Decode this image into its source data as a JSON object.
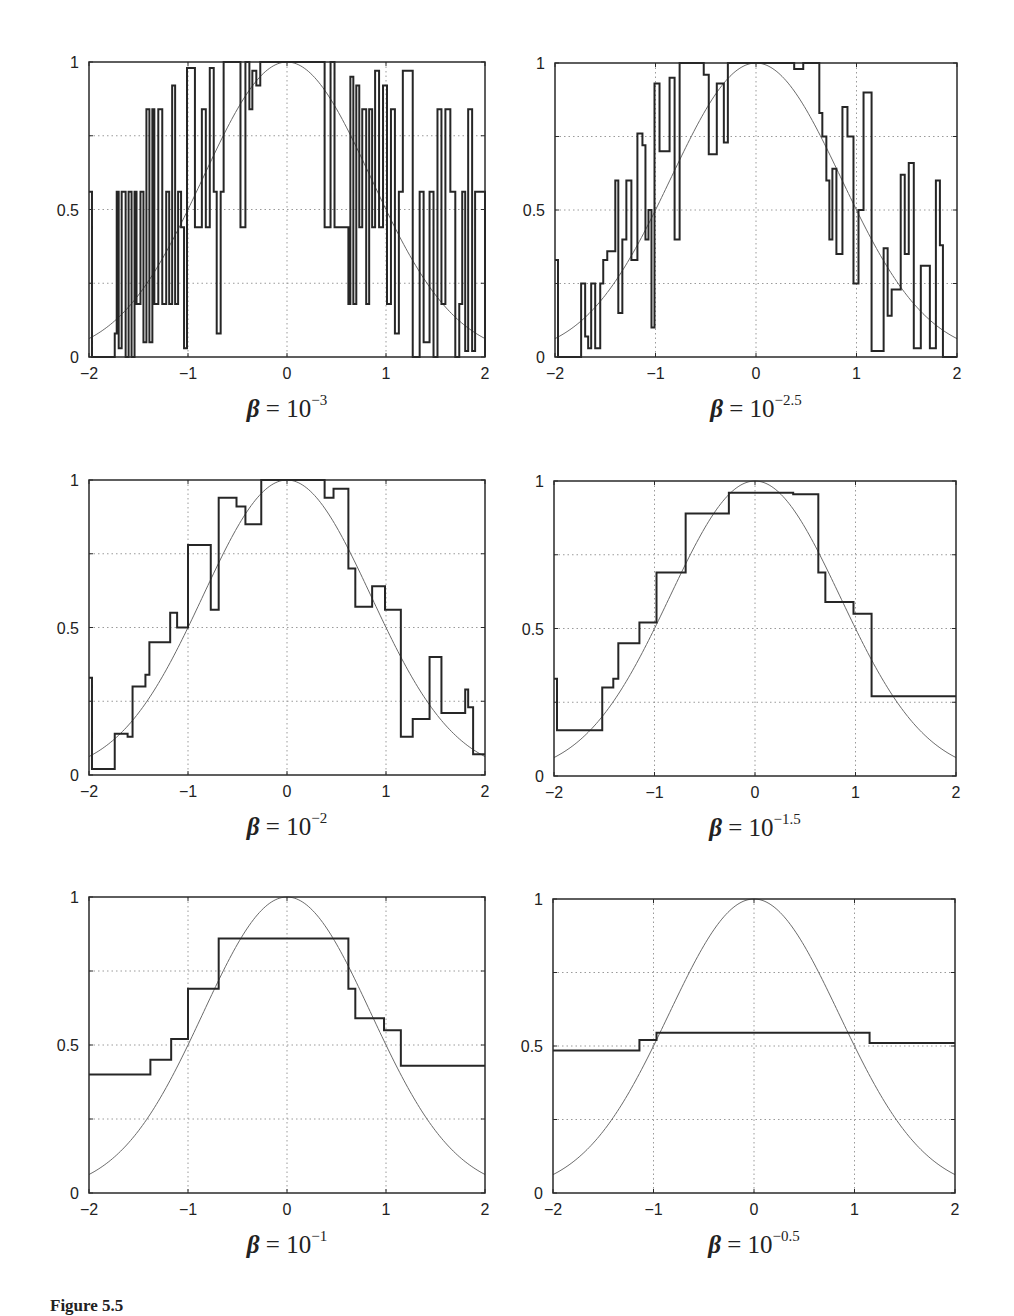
{
  "figure": {
    "label": "Figure 5.5"
  },
  "chart_data": [
    {
      "type": "line",
      "title": "β = 10^-3",
      "caption": {
        "base": "10",
        "exponent": "−3"
      },
      "xlabel": "",
      "ylabel": "",
      "xlim": [
        -2,
        2
      ],
      "ylim": [
        0,
        1
      ],
      "xticks": [
        "−2",
        "−1",
        "0",
        "1",
        "2"
      ],
      "yticks": [
        "0",
        "0.5",
        "1"
      ],
      "grid": true,
      "frame": {
        "left": 89,
        "top": 62,
        "right": 485,
        "bottom": 357
      },
      "series": [
        {
          "name": "target",
          "kind": "smooth",
          "formula": "2^(-x^2)"
        },
        {
          "name": "estimate",
          "kind": "step",
          "x": [
            -2.0,
            -1.97,
            -1.74,
            -1.72,
            -1.7,
            -1.67,
            -1.63,
            -1.6,
            -1.57,
            -1.54,
            -1.52,
            -1.48,
            -1.45,
            -1.42,
            -1.39,
            -1.36,
            -1.34,
            -1.3,
            -1.26,
            -1.22,
            -1.19,
            -1.16,
            -1.13,
            -1.1,
            -1.07,
            -1.04,
            -1.01,
            -0.98,
            -0.93,
            -0.86,
            -0.82,
            -0.78,
            -0.74,
            -0.71,
            -0.67,
            -0.64,
            -0.6,
            -0.55,
            -0.47,
            -0.42,
            -0.38,
            -0.35,
            -0.31,
            -0.27,
            0.38,
            0.44,
            0.48,
            0.62,
            0.64,
            0.67,
            0.7,
            0.73,
            0.76,
            0.8,
            0.83,
            0.86,
            0.89,
            0.93,
            0.97,
            1.01,
            1.05,
            1.09,
            1.13,
            1.17,
            1.27,
            1.31,
            1.34,
            1.38,
            1.44,
            1.48,
            1.52,
            1.56,
            1.6,
            1.65,
            1.7,
            1.74,
            1.77,
            1.8,
            1.83,
            1.87,
            1.9,
            2.0
          ],
          "y": [
            0.56,
            0.0,
            0.08,
            0.56,
            0.03,
            0.56,
            0.0,
            0.56,
            0.0,
            0.56,
            0.18,
            0.56,
            0.05,
            0.84,
            0.05,
            0.84,
            0.18,
            0.84,
            0.18,
            0.56,
            0.18,
            0.92,
            0.18,
            0.56,
            0.44,
            0.03,
            0.98,
            0.98,
            0.44,
            0.84,
            0.44,
            0.98,
            0.56,
            0.08,
            0.56,
            1.0,
            1.0,
            1.0,
            0.44,
            1.0,
            0.84,
            0.97,
            0.92,
            1.0,
            0.44,
            1.0,
            0.44,
            0.18,
            0.95,
            0.18,
            0.92,
            0.44,
            0.84,
            0.18,
            0.84,
            0.44,
            0.97,
            0.44,
            0.92,
            0.18,
            0.84,
            0.08,
            0.56,
            0.97,
            0.0,
            0.0,
            0.56,
            0.05,
            0.56,
            0.0,
            0.84,
            0.18,
            0.84,
            0.56,
            0.0,
            0.18,
            0.56,
            0.02,
            0.84,
            0.02,
            0.56,
            0.0
          ]
        }
      ]
    },
    {
      "type": "line",
      "title": "β = 10^-2.5",
      "caption": {
        "base": "10",
        "exponent": "−2.5"
      },
      "xlabel": "",
      "ylabel": "",
      "xlim": [
        -2,
        2
      ],
      "ylim": [
        0,
        1
      ],
      "xticks": [
        "−2",
        "−1",
        "0",
        "1",
        "2"
      ],
      "yticks": [
        "0",
        "0.5",
        "1"
      ],
      "grid": true,
      "frame": {
        "left": 555,
        "top": 63,
        "right": 957,
        "bottom": 357
      },
      "series": [
        {
          "name": "target",
          "kind": "smooth",
          "formula": "2^(-x^2)"
        },
        {
          "name": "estimate",
          "kind": "step",
          "x": [
            -2.0,
            -1.97,
            -1.74,
            -1.7,
            -1.67,
            -1.64,
            -1.6,
            -1.55,
            -1.52,
            -1.48,
            -1.4,
            -1.37,
            -1.33,
            -1.29,
            -1.24,
            -1.18,
            -1.13,
            -1.1,
            -1.07,
            -1.04,
            -1.01,
            -0.96,
            -0.86,
            -0.81,
            -0.76,
            -0.69,
            -0.52,
            -0.47,
            -0.39,
            -0.32,
            -0.28,
            -0.24,
            0.38,
            0.47,
            0.63,
            0.66,
            0.7,
            0.73,
            0.76,
            0.8,
            0.86,
            0.91,
            0.97,
            1.02,
            1.07,
            1.15,
            1.27,
            1.31,
            1.35,
            1.44,
            1.48,
            1.52,
            1.57,
            1.64,
            1.73,
            1.79,
            1.83,
            1.86,
            2.0
          ],
          "y": [
            0.33,
            0.0,
            0.25,
            0.07,
            0.03,
            0.25,
            0.03,
            0.25,
            0.33,
            0.36,
            0.6,
            0.15,
            0.4,
            0.6,
            0.33,
            0.76,
            0.72,
            0.4,
            0.5,
            0.1,
            0.93,
            0.7,
            0.95,
            0.4,
            1.0,
            1.0,
            0.96,
            0.69,
            0.93,
            0.73,
            1.0,
            1.0,
            0.98,
            1.0,
            0.83,
            0.75,
            0.6,
            0.4,
            0.64,
            0.35,
            0.85,
            0.75,
            0.25,
            0.5,
            0.9,
            0.02,
            0.37,
            0.14,
            0.23,
            0.62,
            0.35,
            0.66,
            0.03,
            0.31,
            0.03,
            0.6,
            0.38,
            0.0,
            0.0
          ]
        }
      ]
    },
    {
      "type": "line",
      "title": "β = 10^-2",
      "caption": {
        "base": "10",
        "exponent": "−2"
      },
      "xlabel": "",
      "ylabel": "",
      "xlim": [
        -2,
        2
      ],
      "ylim": [
        0,
        1
      ],
      "xticks": [
        "−2",
        "−1",
        "0",
        "1",
        "2"
      ],
      "yticks": [
        "0",
        "0.5",
        "1"
      ],
      "grid": true,
      "frame": {
        "left": 89,
        "top": 480,
        "right": 485,
        "bottom": 775
      },
      "series": [
        {
          "name": "target",
          "kind": "smooth",
          "formula": "2^(-x^2)"
        },
        {
          "name": "estimate",
          "kind": "step",
          "x": [
            -2.0,
            -1.97,
            -1.74,
            -1.61,
            -1.56,
            -1.43,
            -1.39,
            -1.18,
            -1.11,
            -1.0,
            -0.77,
            -0.69,
            -0.51,
            -0.42,
            -0.26,
            0.38,
            0.47,
            0.62,
            0.69,
            0.86,
            0.99,
            1.15,
            1.27,
            1.44,
            1.56,
            1.8,
            1.83,
            1.88,
            2.0
          ],
          "y": [
            0.33,
            0.02,
            0.14,
            0.13,
            0.3,
            0.34,
            0.45,
            0.55,
            0.5,
            0.78,
            0.56,
            0.94,
            0.91,
            0.85,
            1.0,
            0.94,
            0.97,
            0.7,
            0.57,
            0.64,
            0.56,
            0.13,
            0.19,
            0.4,
            0.21,
            0.29,
            0.23,
            0.07,
            0.07
          ]
        }
      ]
    },
    {
      "type": "line",
      "title": "β = 10^-1.5",
      "caption": {
        "base": "10",
        "exponent": "−1.5"
      },
      "xlabel": "",
      "ylabel": "",
      "xlim": [
        -2,
        2
      ],
      "ylim": [
        0,
        1
      ],
      "xticks": [
        "−2",
        "−1",
        "0",
        "1",
        "2"
      ],
      "yticks": [
        "0",
        "0.5",
        "1"
      ],
      "grid": true,
      "frame": {
        "left": 554,
        "top": 481,
        "right": 956,
        "bottom": 776
      },
      "series": [
        {
          "name": "target",
          "kind": "smooth",
          "formula": "2^(-x^2)"
        },
        {
          "name": "estimate",
          "kind": "step",
          "x": [
            -2.0,
            -1.97,
            -1.52,
            -1.41,
            -1.36,
            -1.15,
            -0.98,
            -0.69,
            -0.26,
            0.38,
            0.63,
            0.7,
            0.98,
            1.16,
            2.0
          ],
          "y": [
            0.33,
            0.155,
            0.3,
            0.33,
            0.45,
            0.52,
            0.69,
            0.89,
            0.96,
            0.955,
            0.69,
            0.59,
            0.55,
            0.27,
            0.27
          ]
        }
      ]
    },
    {
      "type": "line",
      "title": "β = 10^-1",
      "caption": {
        "base": "10",
        "exponent": "−1"
      },
      "xlabel": "",
      "ylabel": "",
      "xlim": [
        -2,
        2
      ],
      "ylim": [
        0,
        1
      ],
      "xticks": [
        "−2",
        "−1",
        "0",
        "1",
        "2"
      ],
      "yticks": [
        "0",
        "0.5",
        "1"
      ],
      "grid": true,
      "frame": {
        "left": 89,
        "top": 897,
        "right": 485,
        "bottom": 1193
      },
      "series": [
        {
          "name": "target",
          "kind": "smooth",
          "formula": "2^(-x^2)"
        },
        {
          "name": "estimate",
          "kind": "step",
          "x": [
            -2.0,
            -1.38,
            -1.17,
            -1.0,
            -0.69,
            0.62,
            0.69,
            0.98,
            1.15,
            2.0
          ],
          "y": [
            0.4,
            0.45,
            0.52,
            0.69,
            0.86,
            0.69,
            0.59,
            0.55,
            0.43,
            0.43
          ]
        }
      ]
    },
    {
      "type": "line",
      "title": "β = 10^-0.5",
      "caption": {
        "base": "10",
        "exponent": "−0.5"
      },
      "xlabel": "",
      "ylabel": "",
      "xlim": [
        -2,
        2
      ],
      "ylim": [
        0,
        1
      ],
      "xticks": [
        "−2",
        "−1",
        "0",
        "1",
        "2"
      ],
      "yticks": [
        "0",
        "0.5",
        "1"
      ],
      "grid": true,
      "frame": {
        "left": 553,
        "top": 899,
        "right": 955,
        "bottom": 1193
      },
      "series": [
        {
          "name": "target",
          "kind": "smooth",
          "formula": "2^(-x^2)"
        },
        {
          "name": "estimate",
          "kind": "step",
          "x": [
            -2.0,
            -1.14,
            -0.97,
            1.15,
            2.0
          ],
          "y": [
            0.485,
            0.52,
            0.545,
            0.51,
            0.51
          ]
        }
      ]
    }
  ],
  "colors": {
    "frame": "#2a2a2a",
    "step": "#262626",
    "curve": "#6a6a6a",
    "grid": "#9a9a9a"
  }
}
